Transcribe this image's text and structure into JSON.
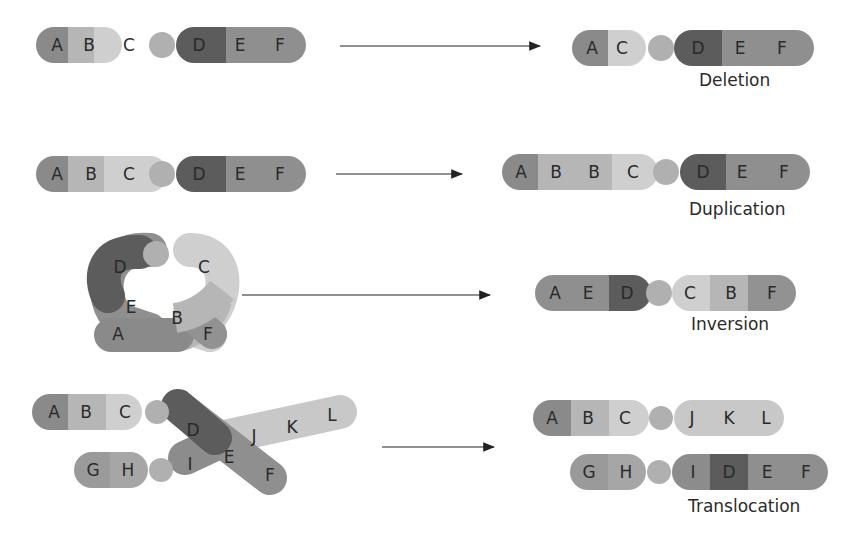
{
  "colors": {
    "A": "#8a8a8a",
    "B": "#b6b6b6",
    "C": "#cfcfcf",
    "D": "#5c5c5c",
    "E": "#8f8f8f",
    "F": "#929292",
    "centromere": "#b0b0b0",
    "G": "#9a9a9a",
    "H": "#a6a6a6",
    "I": "#8c8c8c",
    "J": "#c8c8c8",
    "K": "#c4c4c4",
    "L": "#c6c6c6"
  },
  "rows": [
    {
      "name": "deletion",
      "before": [
        "A",
        "B",
        "C",
        "o",
        "D",
        "E",
        "F"
      ],
      "after": [
        "A",
        "C",
        "o",
        "D",
        "E",
        "F"
      ],
      "caption": "Deletion"
    },
    {
      "name": "duplication",
      "before": [
        "A",
        "B",
        "C",
        "o",
        "D",
        "E",
        "F"
      ],
      "after": [
        "A",
        "B",
        "B",
        "C",
        "o",
        "D",
        "E",
        "F"
      ],
      "caption": "Duplication"
    },
    {
      "name": "inversion",
      "before_loop": [
        "A",
        "E",
        "D",
        "o",
        "C",
        "B",
        "F"
      ],
      "after": [
        "A",
        "E",
        "D",
        "o",
        "C",
        "B",
        "F"
      ],
      "caption": "Inversion"
    },
    {
      "name": "translocation",
      "before": [
        [
          "A",
          "B",
          "C",
          "o"
        ],
        [
          "G",
          "H",
          "o"
        ],
        [
          "D",
          "E",
          "F"
        ],
        [
          "I"
        ],
        [
          "J",
          "K",
          "L"
        ]
      ],
      "after": [
        [
          "A",
          "B",
          "C",
          "o",
          "J",
          "K",
          "L"
        ],
        [
          "G",
          "H",
          "o",
          "I",
          "D",
          "E",
          "F"
        ]
      ],
      "caption": "Translocation"
    }
  ],
  "labels": {
    "A": "A",
    "B": "B",
    "C": "C",
    "D": "D",
    "E": "E",
    "F": "F",
    "G": "G",
    "H": "H",
    "I": "I",
    "J": "J",
    "K": "K",
    "L": "L"
  }
}
